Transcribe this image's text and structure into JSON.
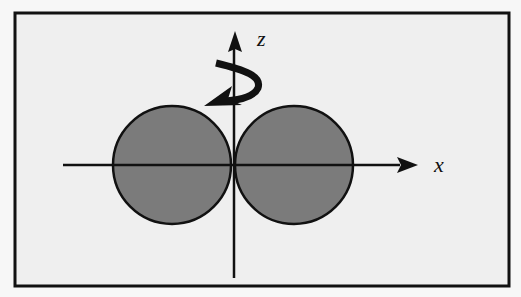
{
  "diagram": {
    "axes": {
      "x_label": "x",
      "z_label": "z"
    },
    "rotation_arrow": "curved-rotation-arrow around z-axis",
    "colors": {
      "frame_background": "#efefef",
      "page_background": "#f7f7f7",
      "circle_fill": "#7b7b7b",
      "stroke": "#111111"
    },
    "circles": [
      {
        "name": "left-sphere",
        "cx": 172,
        "cy": 165,
        "r": 59
      },
      {
        "name": "right-sphere",
        "cx": 294,
        "cy": 165,
        "r": 59
      }
    ]
  }
}
